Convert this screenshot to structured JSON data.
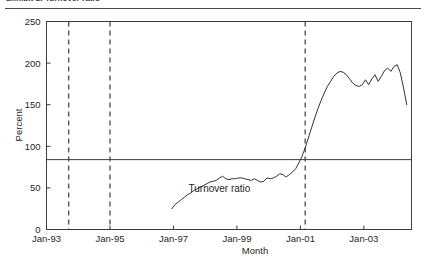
{
  "caption": {
    "text": "Exhibit 2. Turnover ratio"
  },
  "chart_data": {
    "type": "line",
    "title": "",
    "subtitle": "",
    "xlabel": "Month",
    "ylabel": "Percent",
    "xlim": [
      1993.0,
      2004.5
    ],
    "ylim": [
      0,
      250
    ],
    "yticks": [
      0,
      50,
      100,
      150,
      200,
      250
    ],
    "ytick_labels": [
      "0",
      "50",
      "100",
      "150",
      "200",
      "250"
    ],
    "xticks": [
      1993.0,
      1995.0,
      1997.0,
      1999.0,
      2001.0,
      2003.0
    ],
    "xtick_labels": [
      "Jan-93",
      "Jan-95",
      "Jan-97",
      "Jan-99",
      "Jan-01",
      "Jan-03"
    ],
    "grid": false,
    "legend": "none",
    "line_color": "#333333",
    "annotations": [
      {
        "name": "series-label",
        "text": "Turnover ratio",
        "x": 1998.45,
        "y": 45
      }
    ],
    "reference_lines": [
      {
        "name": "mean-level",
        "orientation": "horizontal",
        "value": 84,
        "style": "solid"
      },
      {
        "name": "event-marker-1",
        "orientation": "vertical",
        "value": 1993.7,
        "style": "dashed"
      },
      {
        "name": "event-marker-2",
        "orientation": "vertical",
        "value": 1995.0,
        "style": "dashed"
      },
      {
        "name": "event-marker-3",
        "orientation": "vertical",
        "value": 2001.15,
        "style": "dashed"
      }
    ],
    "series": [
      {
        "name": "Turnover ratio",
        "x": [
          1996.95,
          1997.05,
          1997.15,
          1997.25,
          1997.35,
          1997.45,
          1997.55,
          1997.65,
          1997.75,
          1997.85,
          1997.95,
          1998.05,
          1998.15,
          1998.25,
          1998.35,
          1998.45,
          1998.55,
          1998.65,
          1998.75,
          1998.85,
          1998.95,
          1999.05,
          1999.15,
          1999.25,
          1999.35,
          1999.45,
          1999.55,
          1999.65,
          1999.75,
          1999.85,
          1999.95,
          2000.05,
          2000.15,
          2000.25,
          2000.35,
          2000.45,
          2000.55,
          2000.65,
          2000.75,
          2000.85,
          2000.95,
          2001.05,
          2001.15,
          2001.25,
          2001.35,
          2001.45,
          2001.55,
          2001.65,
          2001.75,
          2001.85,
          2001.95,
          2002.05,
          2002.15,
          2002.25,
          2002.35,
          2002.45,
          2002.55,
          2002.65,
          2002.75,
          2002.85,
          2002.95,
          2003.05,
          2003.15,
          2003.25,
          2003.35,
          2003.45,
          2003.55,
          2003.65,
          2003.75,
          2003.85,
          2003.95,
          2004.05,
          2004.15,
          2004.25,
          2004.35
        ],
        "y": [
          25,
          30,
          33,
          36,
          39,
          42,
          44,
          47,
          49,
          51,
          53,
          55,
          57,
          58,
          59,
          62,
          64,
          61,
          60,
          61,
          61,
          62,
          62,
          61,
          60,
          59,
          61,
          59,
          57,
          58,
          62,
          61,
          62,
          64,
          67,
          66,
          63,
          66,
          69,
          73,
          80,
          88,
          98,
          110,
          122,
          134,
          145,
          155,
          164,
          172,
          178,
          184,
          188,
          190,
          189,
          186,
          181,
          176,
          173,
          172,
          174,
          180,
          174,
          181,
          186,
          178,
          184,
          191,
          194,
          190,
          196,
          198,
          188,
          170,
          150
        ]
      }
    ]
  },
  "axes": {
    "y_label": "Percent",
    "x_label": "Month"
  }
}
